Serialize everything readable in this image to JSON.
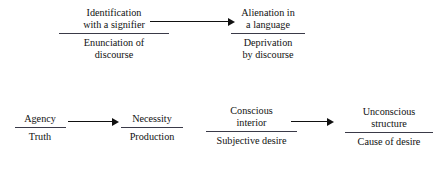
{
  "diagram": {
    "type": "concept-diagram",
    "background_color": "#ffffff",
    "text_color": "#111111",
    "rule_color": "#3a3a48",
    "rows": [
      {
        "id": "row-top",
        "nodes": [
          {
            "id": "identification",
            "numerator": "Identification\nwith a signifier",
            "denominator": "Enunciation of\ndiscourse"
          },
          {
            "id": "alienation",
            "numerator": "Alienation in\na language",
            "denominator": "Deprivation\nby discourse"
          }
        ],
        "arrows": [
          {
            "id": "arrow-top",
            "from": "identification",
            "to": "alienation",
            "direction": "right"
          }
        ]
      },
      {
        "id": "row-bottom",
        "nodes": [
          {
            "id": "agency",
            "numerator": "Agency",
            "denominator": "Truth"
          },
          {
            "id": "necessity",
            "numerator": "Necessity",
            "denominator": "Production"
          },
          {
            "id": "conscious",
            "numerator": "Conscious\ninterior",
            "denominator": "Subjective desire"
          },
          {
            "id": "unconscious",
            "numerator": "Unconscious\nstructure",
            "denominator": "Cause of desire"
          }
        ],
        "arrows": [
          {
            "id": "arrow-bottom-1",
            "from": "agency",
            "to": "necessity",
            "direction": "right"
          },
          {
            "id": "arrow-bottom-2",
            "from": "conscious",
            "to": "unconscious",
            "direction": "right"
          }
        ]
      }
    ]
  }
}
